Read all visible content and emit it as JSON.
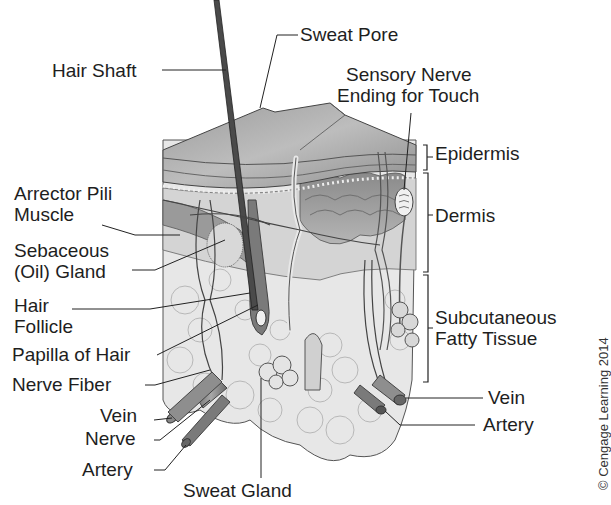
{
  "diagram": {
    "labels": {
      "hair_shaft": "Hair Shaft",
      "sweat_pore": "Sweat Pore",
      "sensory_nerve_line1": "Sensory Nerve",
      "sensory_nerve_line2": "Ending for Touch",
      "epidermis": "Epidermis",
      "dermis": "Dermis",
      "subcutaneous_line1": "Subcutaneous",
      "subcutaneous_line2": "Fatty Tissue",
      "arrector_line1": "Arrector Pili",
      "arrector_line2": "Muscle",
      "sebaceous_line1": "Sebaceous",
      "sebaceous_line2": "(Oil) Gland",
      "hair_follicle_line1": "Hair",
      "hair_follicle_line2": "Follicle",
      "papilla": "Papilla of Hair",
      "nerve_fiber": "Nerve Fiber",
      "vein_left": "Vein",
      "nerve_left": "Nerve",
      "artery_left": "Artery",
      "sweat_gland": "Sweat Gland",
      "vein_right": "Vein",
      "artery_right": "Artery"
    },
    "layers": [
      "Epidermis",
      "Dermis",
      "Subcutaneous Fatty Tissue"
    ],
    "copyright": "© Cengage Learning 2014"
  }
}
